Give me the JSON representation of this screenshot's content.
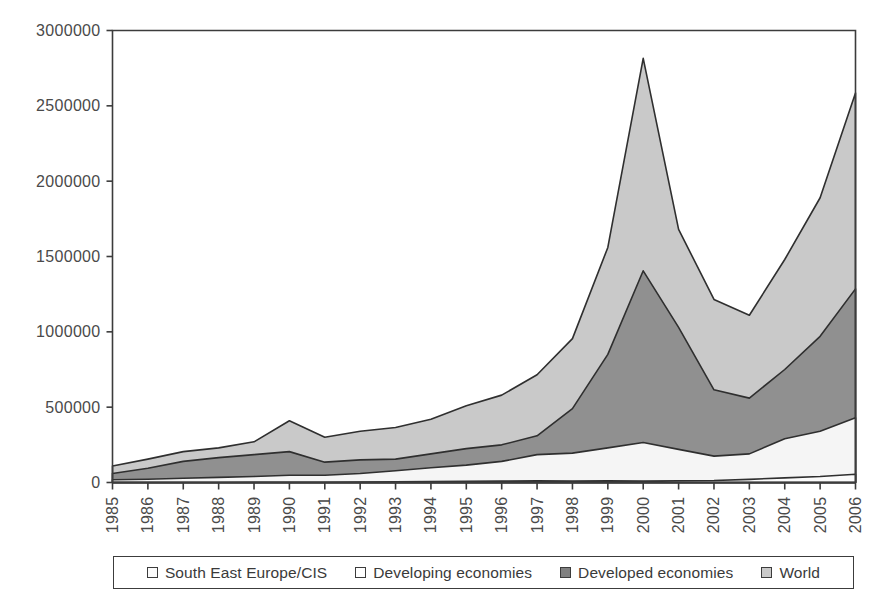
{
  "chart_data": {
    "type": "area",
    "title": "",
    "subtitle": "",
    "xlabel": "",
    "ylabel": "",
    "grid": false,
    "stacked": false,
    "legend_position": "bottom",
    "xlim": [
      1985,
      2006
    ],
    "ylim": [
      0,
      3000000
    ],
    "ytick_step": 500000,
    "categories": [
      "1985",
      "1986",
      "1987",
      "1988",
      "1989",
      "1990",
      "1991",
      "1992",
      "1993",
      "1994",
      "1995",
      "1996",
      "1997",
      "1998",
      "1999",
      "2000",
      "2001",
      "2002",
      "2003",
      "2004",
      "2005",
      "2006"
    ],
    "ytick_labels": [
      "0",
      "500000",
      "1000000",
      "1500000",
      "2000000",
      "2500000",
      "3000000"
    ],
    "ytick_values": [
      0,
      500000,
      1000000,
      1500000,
      2000000,
      2500000,
      3000000
    ],
    "series": [
      {
        "name": "World",
        "color": "#c9c9c9",
        "values": [
          110000,
          155000,
          205000,
          230000,
          270000,
          410000,
          300000,
          340000,
          365000,
          420000,
          510000,
          580000,
          715000,
          955000,
          1560000,
          2815000,
          1680000,
          1215000,
          1110000,
          1480000,
          1890000,
          2585000
        ]
      },
      {
        "name": "Developed economies",
        "color": "#909090",
        "values": [
          60000,
          95000,
          140000,
          165000,
          185000,
          205000,
          135000,
          150000,
          155000,
          190000,
          225000,
          250000,
          310000,
          490000,
          850000,
          1405000,
          1030000,
          615000,
          560000,
          750000,
          970000,
          1285000
        ]
      },
      {
        "name": "Developing economies",
        "color": "#f5f5f5",
        "values": [
          18000,
          22000,
          28000,
          34000,
          40000,
          48000,
          48000,
          60000,
          78000,
          98000,
          115000,
          140000,
          185000,
          195000,
          230000,
          265000,
          220000,
          175000,
          190000,
          290000,
          340000,
          430000
        ]
      },
      {
        "name": "South East Europe/CIS",
        "color": "#fbfbfb",
        "values": [
          0,
          0,
          0,
          0,
          500,
          1000,
          1600,
          3000,
          5000,
          6500,
          8000,
          9000,
          11000,
          9000,
          11000,
          9000,
          12000,
          13000,
          21000,
          31000,
          40000,
          55000
        ]
      }
    ]
  },
  "legend": {
    "entries": [
      {
        "label": "South East Europe/CIS",
        "swatch": "#fbfbfb"
      },
      {
        "label": "Developing economies",
        "swatch": "#ffffff"
      },
      {
        "label": "Developed economies",
        "swatch": "#808080"
      },
      {
        "label": "World",
        "swatch": "#c9c9c9"
      }
    ]
  },
  "axes": {
    "outline_color": "#3c3c3c"
  }
}
